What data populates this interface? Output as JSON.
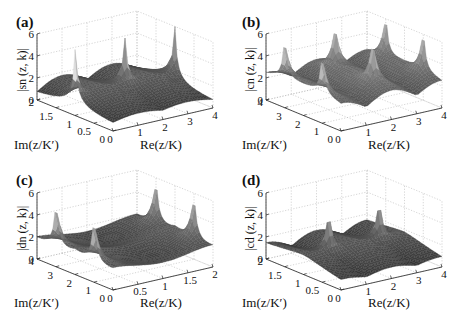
{
  "figure": {
    "panels": [
      {
        "id": "a",
        "label": "(a)",
        "zlabel": "|sn (z, k)|",
        "xlabel": "Re(z/K)",
        "ylabel": "Im(z/K′)"
      },
      {
        "id": "b",
        "label": "(b)",
        "zlabel": "|cn (z, k)|",
        "xlabel": "Re(z/K)",
        "ylabel": "Im(z/K′)"
      },
      {
        "id": "c",
        "label": "(c)",
        "zlabel": "|dn (z, k)|",
        "xlabel": "Re(z/K)",
        "ylabel": "Im(z/K′)"
      },
      {
        "id": "d",
        "label": "(d)",
        "zlabel": "|cd (z, k)|",
        "xlabel": "Re(z/K)",
        "ylabel": "Im(z/K′)"
      }
    ]
  },
  "chart_data": [
    {
      "type": "surface",
      "panel": "(a)",
      "function": "sn",
      "title": "",
      "zlabel": "|sn (z, k)|",
      "xlabel": "Re(z/K)",
      "ylabel": "Im(z/K′)",
      "xlim": [
        0,
        4
      ],
      "ylim": [
        0,
        2
      ],
      "zlim": [
        0,
        6
      ],
      "xticks": [
        "0",
        "1",
        "2",
        "3",
        "4"
      ],
      "yticks": [
        "0",
        "0.5",
        "1",
        "1.5",
        "2"
      ],
      "zticks": [
        "0",
        "2",
        "4",
        "6"
      ],
      "poles": [
        [
          0,
          1
        ],
        [
          2,
          1
        ],
        [
          4,
          1
        ]
      ],
      "grid": true
    },
    {
      "type": "surface",
      "panel": "(b)",
      "function": "cn",
      "zlabel": "|cn (z, k)|",
      "xlabel": "Re(z/K)",
      "ylabel": "Im(z/K′)",
      "xlim": [
        0,
        4
      ],
      "ylim": [
        0,
        4
      ],
      "zlim": [
        0,
        6
      ],
      "xticks": [
        "0",
        "1",
        "2",
        "3",
        "4"
      ],
      "yticks": [
        "0",
        "1",
        "2",
        "3",
        "4"
      ],
      "zticks": [
        "0",
        "2",
        "4",
        "6"
      ],
      "poles": [
        [
          0,
          1
        ],
        [
          2,
          1
        ],
        [
          4,
          1
        ],
        [
          0,
          3
        ],
        [
          2,
          3
        ],
        [
          4,
          3
        ]
      ],
      "grid": true
    },
    {
      "type": "surface",
      "panel": "(c)",
      "function": "dn",
      "zlabel": "|dn (z, k)|",
      "xlabel": "Re(z/K)",
      "ylabel": "Im(z/K′)",
      "xlim": [
        0,
        2
      ],
      "ylim": [
        0,
        4
      ],
      "zlim": [
        0,
        6
      ],
      "xticks": [
        "0",
        "0.5",
        "1",
        "1.5",
        "2"
      ],
      "yticks": [
        "0",
        "1",
        "2",
        "3",
        "4"
      ],
      "zticks": [
        "0",
        "2",
        "4",
        "6"
      ],
      "poles": [
        [
          0,
          1
        ],
        [
          0,
          3
        ],
        [
          2,
          1
        ],
        [
          2,
          3
        ]
      ],
      "grid": true
    },
    {
      "type": "surface",
      "panel": "(d)",
      "function": "cd",
      "zlabel": "|cd (z, k)|",
      "xlabel": "Re(z/K)",
      "ylabel": "Im(z/K′)",
      "xlim": [
        0,
        4
      ],
      "ylim": [
        0,
        2
      ],
      "zlim": [
        0,
        6
      ],
      "xticks": [
        "0",
        "1",
        "2",
        "3",
        "4"
      ],
      "yticks": [
        "0",
        "0.5",
        "1",
        "1.5",
        "2"
      ],
      "zticks": [
        "0",
        "2",
        "4",
        "6"
      ],
      "poles": [
        [
          1,
          1
        ],
        [
          3,
          1
        ]
      ],
      "grid": true
    }
  ]
}
